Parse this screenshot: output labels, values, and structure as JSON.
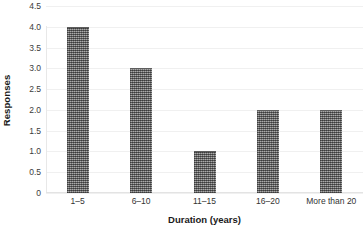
{
  "chart_data": {
    "type": "bar",
    "title": "",
    "subtitle": "",
    "xlabel": "Duration (years)",
    "ylabel": "Responses",
    "categories": [
      "1–5",
      "6–10",
      "11–15",
      "16–20",
      "More than 20"
    ],
    "values": [
      4,
      3,
      1,
      2,
      2
    ],
    "ylim": [
      0,
      4.5
    ],
    "yticks": [
      0,
      0.5,
      1.0,
      1.5,
      2.0,
      2.5,
      3.0,
      3.5,
      4.0,
      4.5
    ],
    "ytick_labels": [
      "0",
      "0.5",
      "1.0",
      "1.5",
      "2.0",
      "2.5",
      "3.0",
      "3.5",
      "4.0",
      "4.5"
    ],
    "grid": true,
    "grid_axis": "y",
    "legend": false,
    "legend_position": "none",
    "bar_color": "#7a7a7a",
    "bar_pattern": "halftone-checker",
    "gridline_color": "#f0f0f0",
    "axis_color": "#e3e3e3",
    "background_color": "#ffffff"
  }
}
